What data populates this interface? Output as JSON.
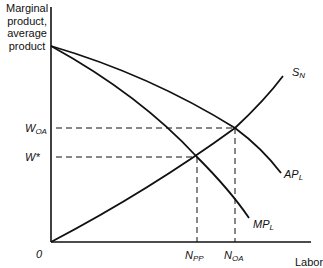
{
  "axes": {
    "y_title": [
      "Marginal",
      "product,",
      "average",
      "product"
    ],
    "x_title": "Labor",
    "origin": "0"
  },
  "y_ticks": [
    {
      "main": "W",
      "sub": "OA"
    },
    {
      "main": "W*",
      "sub": ""
    }
  ],
  "x_ticks": [
    {
      "main": "N",
      "sub": "PP"
    },
    {
      "main": "N",
      "sub": "OA"
    }
  ],
  "curves": [
    {
      "main": "S",
      "sub": "N"
    },
    {
      "main": "AP",
      "sub": "L"
    },
    {
      "main": "MP",
      "sub": "L"
    }
  ],
  "colors": {
    "line": "#111111",
    "background": "#ffffff"
  }
}
